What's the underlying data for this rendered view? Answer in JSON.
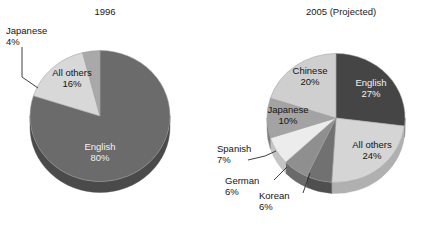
{
  "figure": {
    "background_color": "#ffffff",
    "charts": [
      {
        "key": "pie1996",
        "title": "1996",
        "type": "pie",
        "center": [
          100,
          116
        ],
        "radius": 70,
        "depth": 11,
        "start_angle_deg": 0,
        "slices": [
          {
            "label": "English",
            "value": 80,
            "value_label": "80%",
            "color": "#6b6b6b",
            "side_color": "#4a4a4a",
            "text_color": "#f0f0f0",
            "label_inside": true,
            "label_pos": [
              100,
              150
            ]
          },
          {
            "label": "All others",
            "value": 16,
            "value_label": "16%",
            "color": "#d8d8d8",
            "side_color": "#b4b4b4",
            "text_color": "#141414",
            "label_inside": true,
            "label_pos": [
              72,
              76
            ]
          },
          {
            "label": "Japanese",
            "value": 4,
            "value_label": "4%",
            "color": "#a9a9a9",
            "side_color": "#8a8a8a",
            "text_color": "#141414",
            "label_inside": false,
            "label_pos": [
              6,
              34
            ],
            "leader": [
              [
                22,
                47
              ],
              [
                22,
                77
              ],
              [
                38,
                88
              ]
            ]
          }
        ]
      },
      {
        "key": "pie2005",
        "title": "2005 (Projected)",
        "type": "pie",
        "center": [
          336,
          118
        ],
        "radius": 69,
        "depth": 11,
        "start_angle_deg": 0,
        "slices": [
          {
            "label": "English",
            "value": 27,
            "value_label": "27%",
            "color": "#454545",
            "side_color": "#2e2e2e",
            "text_color": "#f0f0f0",
            "label_inside": true,
            "label_pos": [
              371,
              86
            ]
          },
          {
            "label": "All others",
            "value": 24,
            "value_label": "24%",
            "color": "#d5d5d5",
            "side_color": "#b0b0b0",
            "text_color": "#141414",
            "label_inside": true,
            "label_pos": [
              372,
              148
            ]
          },
          {
            "label": "Korean",
            "value": 6,
            "value_label": "6%",
            "color": "#717171",
            "side_color": "#4f4f4f",
            "text_color": "#141414",
            "label_inside": false,
            "label_pos": [
              259,
              199
            ],
            "leader": [
              [
                303,
                193
              ],
              [
                310,
                173
              ]
            ]
          },
          {
            "label": "German",
            "value": 6,
            "value_label": "6%",
            "color": "#8f8f8f",
            "side_color": "#6a6a6a",
            "text_color": "#141414",
            "label_inside": false,
            "label_pos": [
              225,
              184
            ],
            "leader": [
              [
                274,
                180
              ],
              [
                287,
                167
              ]
            ]
          },
          {
            "label": "Spanish",
            "value": 7,
            "value_label": "7%",
            "color": "#ececec",
            "side_color": "#c4c4c4",
            "text_color": "#141414",
            "label_inside": false,
            "label_pos": [
              217,
              152
            ],
            "leader": [
              [
                248,
                160
              ],
              [
                265,
                156
              ],
              [
                276,
                151
              ]
            ]
          },
          {
            "label": "Japanese",
            "value": 10,
            "value_label": "10%",
            "color": "#a3a3a3",
            "side_color": "#7d7d7d",
            "text_color": "#141414",
            "label_inside": true,
            "label_pos": [
              288,
              113
            ]
          },
          {
            "label": "Chinese",
            "value": 20,
            "value_label": "20%",
            "color": "#cfcfcf",
            "side_color": "#a8a8a8",
            "text_color": "#141414",
            "label_inside": true,
            "label_pos": [
              310,
              74
            ]
          }
        ]
      }
    ]
  },
  "chart_data": [
    {
      "type": "pie",
      "title": "1996",
      "categories": [
        "English",
        "All others",
        "Japanese"
      ],
      "values": [
        80,
        16,
        4
      ],
      "value_labels": [
        "80%",
        "16%",
        "4%"
      ],
      "unit": "percent",
      "colors": [
        "#6b6b6b",
        "#d8d8d8",
        "#a9a9a9"
      ],
      "legend": "none (direct slice labels)",
      "xlabel": "",
      "ylabel": "",
      "three_d": true
    },
    {
      "type": "pie",
      "title": "2005 (Projected)",
      "categories": [
        "English",
        "All others",
        "Korean",
        "German",
        "Spanish",
        "Japanese",
        "Chinese"
      ],
      "values": [
        27,
        24,
        6,
        6,
        7,
        10,
        20
      ],
      "value_labels": [
        "27%",
        "24%",
        "6%",
        "6%",
        "7%",
        "10%",
        "20%"
      ],
      "unit": "percent",
      "colors": [
        "#454545",
        "#d5d5d5",
        "#717171",
        "#8f8f8f",
        "#ececec",
        "#a3a3a3",
        "#cfcfcf"
      ],
      "legend": "none (direct slice labels)",
      "xlabel": "",
      "ylabel": "",
      "three_d": true
    }
  ]
}
